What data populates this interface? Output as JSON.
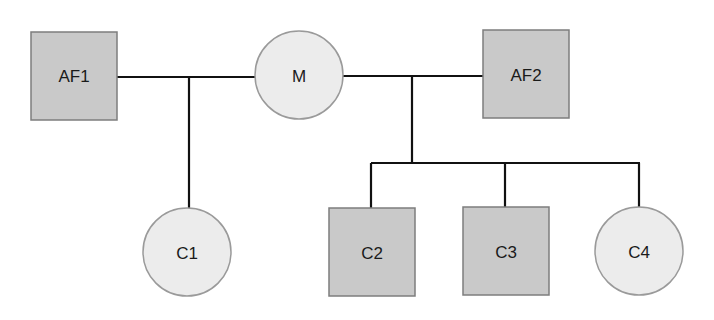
{
  "diagram": {
    "type": "pedigree",
    "colors": {
      "affected_fill": "#c9c9c9",
      "unaffected_fill": "#ececec",
      "node_stroke": "#8a8a8a",
      "line": "#111111"
    },
    "nodes": [
      {
        "id": "AF1",
        "label": "AF1",
        "shape": "square",
        "affected": true
      },
      {
        "id": "M",
        "label": "M",
        "shape": "circle",
        "affected": false
      },
      {
        "id": "AF2",
        "label": "AF2",
        "shape": "square",
        "affected": true
      },
      {
        "id": "C1",
        "label": "C1",
        "shape": "circle",
        "affected": false
      },
      {
        "id": "C2",
        "label": "C2",
        "shape": "square",
        "affected": true
      },
      {
        "id": "C3",
        "label": "C3",
        "shape": "square",
        "affected": true
      },
      {
        "id": "C4",
        "label": "C4",
        "shape": "circle",
        "affected": false
      }
    ],
    "unions": [
      {
        "partners": [
          "AF1",
          "M"
        ],
        "children": [
          "C1"
        ]
      },
      {
        "partners": [
          "M",
          "AF2"
        ],
        "children": [
          "C2",
          "C3",
          "C4"
        ]
      }
    ]
  }
}
